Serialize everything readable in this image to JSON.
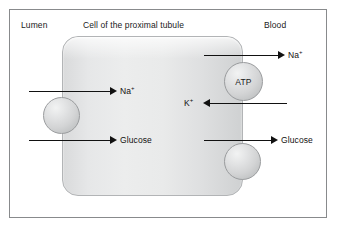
{
  "diagram": {
    "title_regions": {
      "lumen": "Lumen",
      "cell": "Cell of the proximal tubule",
      "blood": "Blood"
    },
    "cell": {
      "name": "proximal-tubule-cell"
    },
    "transporters": [
      {
        "id": "sglt",
        "label": ""
      },
      {
        "id": "atp-pump",
        "label": "ATP"
      },
      {
        "id": "glut",
        "label": ""
      }
    ],
    "solutes": {
      "na_in": {
        "ion": "Na",
        "charge": "+"
      },
      "glucose_in": {
        "name": "Glucose"
      },
      "na_out": {
        "ion": "Na",
        "charge": "+"
      },
      "k_in": {
        "ion": "K",
        "charge": "+"
      },
      "glucose_out": {
        "name": "Glucose"
      }
    },
    "colors": {
      "frame_border": "#888a8c",
      "cell_fill": "#e6e7e8",
      "cell_border": "#b2b4b6",
      "sphere_fill": "#d3d4d5",
      "sphere_border": "#9a9c9e",
      "arrow": "#111111",
      "text": "#1a1a1a",
      "background": "#ffffff"
    }
  }
}
